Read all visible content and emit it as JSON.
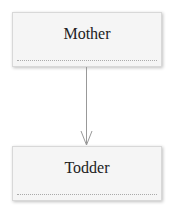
{
  "diagram": {
    "type": "uml-class",
    "classes": [
      {
        "name": "Mother"
      },
      {
        "name": "Todder"
      }
    ],
    "relations": [
      {
        "from": "Mother",
        "to": "Todder",
        "kind": "directed-association",
        "arrow": "open"
      }
    ],
    "colors": {
      "box_fill": "#f5f5f5",
      "box_border": "#d8d8d8",
      "line": "#999999",
      "text": "#222222"
    }
  }
}
